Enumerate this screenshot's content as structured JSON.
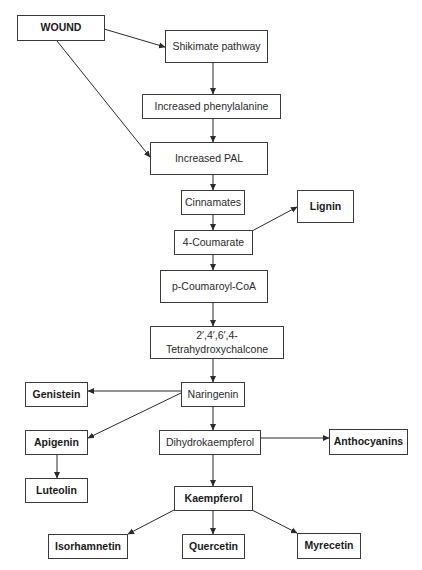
{
  "diagram": {
    "nodes": {
      "wound": {
        "label": "WOUND",
        "emphasis": "bold"
      },
      "shikimate": {
        "label": "Shikimate pathway",
        "emphasis": "normal"
      },
      "phenylalanine": {
        "label": "Increased phenylalanine",
        "emphasis": "normal"
      },
      "pal": {
        "label": "Increased PAL",
        "emphasis": "normal"
      },
      "cinnamates": {
        "label": "Cinnamates",
        "emphasis": "normal"
      },
      "lignin": {
        "label": "Lignin",
        "emphasis": "bold"
      },
      "coumarate": {
        "label": "4-Coumarate",
        "emphasis": "normal"
      },
      "coumaroyl_coa": {
        "label": "p-Coumaroyl-CoA",
        "emphasis": "normal"
      },
      "chalcone_line1": {
        "label": "2′,4′,6′,4-",
        "emphasis": "normal"
      },
      "chalcone_line2": {
        "label": "Tetrahydroxychalcone",
        "emphasis": "normal"
      },
      "genistein": {
        "label": "Genistein",
        "emphasis": "bold"
      },
      "naringenin": {
        "label": "Naringenin",
        "emphasis": "normal"
      },
      "apigenin": {
        "label": "Apigenin",
        "emphasis": "bold"
      },
      "dihydrokaempferol": {
        "label": "Dihydrokaempferol",
        "emphasis": "normal"
      },
      "anthocyanins": {
        "label": "Anthocyanins",
        "emphasis": "bold"
      },
      "luteolin": {
        "label": "Luteolin",
        "emphasis": "bold"
      },
      "kaempferol": {
        "label": "Kaempferol",
        "emphasis": "bold"
      },
      "isorhamnetin": {
        "label": "Isorhamnetin",
        "emphasis": "bold"
      },
      "quercetin": {
        "label": "Quercetin",
        "emphasis": "bold"
      },
      "myrecetin": {
        "label": "Myrecetin",
        "emphasis": "bold"
      }
    },
    "edges": [
      {
        "from": "wound",
        "to": "shikimate"
      },
      {
        "from": "wound",
        "to": "pal"
      },
      {
        "from": "shikimate",
        "to": "phenylalanine"
      },
      {
        "from": "phenylalanine",
        "to": "pal"
      },
      {
        "from": "pal",
        "to": "cinnamates"
      },
      {
        "from": "cinnamates",
        "to": "coumarate"
      },
      {
        "from": "coumarate",
        "to": "lignin"
      },
      {
        "from": "coumarate",
        "to": "coumaroyl_coa"
      },
      {
        "from": "coumaroyl_coa",
        "to": "chalcone"
      },
      {
        "from": "chalcone",
        "to": "naringenin"
      },
      {
        "from": "naringenin",
        "to": "genistein"
      },
      {
        "from": "naringenin",
        "to": "apigenin"
      },
      {
        "from": "naringenin",
        "to": "dihydrokaempferol"
      },
      {
        "from": "apigenin",
        "to": "luteolin"
      },
      {
        "from": "dihydrokaempferol",
        "to": "anthocyanins"
      },
      {
        "from": "dihydrokaempferol",
        "to": "kaempferol"
      },
      {
        "from": "kaempferol",
        "to": "isorhamnetin"
      },
      {
        "from": "kaempferol",
        "to": "quercetin"
      },
      {
        "from": "kaempferol",
        "to": "myrecetin"
      }
    ]
  }
}
